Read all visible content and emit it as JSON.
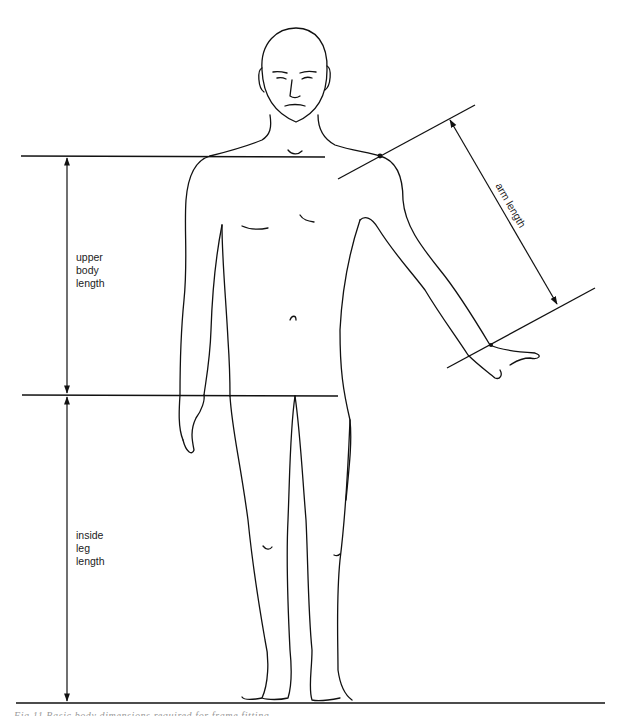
{
  "figure": {
    "caption": "Fig 11   Basic body dimensions required for frame fitting",
    "line_color": "#111111"
  },
  "dimensions": [
    {
      "id": "upper-body-length",
      "label_lines": [
        "upper",
        "body",
        "length"
      ],
      "from": "shoulder line",
      "to": "crotch line"
    },
    {
      "id": "inside-leg-length",
      "label_lines": [
        "inside",
        "leg",
        "length"
      ],
      "from": "crotch line",
      "to": "floor line"
    },
    {
      "id": "arm-length",
      "label": "arm length",
      "from": "shoulder point",
      "to": "wrist"
    }
  ]
}
